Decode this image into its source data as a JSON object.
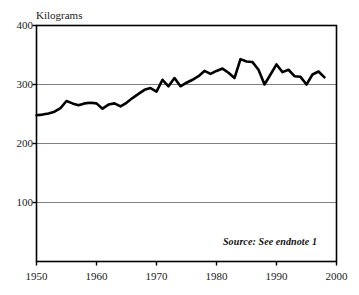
{
  "figure": {
    "y_axis_title": "Kilograms",
    "source_note": "Source: See endnote 1",
    "colors": {
      "line": "#000000",
      "axis": "#000000",
      "grid": "#808080",
      "background": "#ffffff",
      "text": "#111111"
    }
  },
  "chart_data": {
    "type": "line",
    "title": "",
    "subtitle": "",
    "xlabel": "",
    "ylabel": "Kilograms",
    "xlim": [
      1950,
      2000
    ],
    "ylim": [
      0,
      400
    ],
    "grid": true,
    "grid_axis": "y",
    "legend": false,
    "legend_position": "none",
    "annotations": [
      {
        "text": "Source: See endnote 1",
        "x": 1996,
        "y": 38,
        "style": "italic"
      }
    ],
    "ytick_labels": [
      "100",
      "200",
      "300",
      "400"
    ],
    "yticks": [
      100,
      200,
      300,
      400
    ],
    "xtick_labels": [
      "1950",
      "1960",
      "1970",
      "1980",
      "1990",
      "2000"
    ],
    "xticks": [
      1950,
      1960,
      1970,
      1980,
      1990,
      2000
    ],
    "x": [
      1950,
      1951,
      1952,
      1953,
      1954,
      1955,
      1956,
      1957,
      1958,
      1959,
      1960,
      1961,
      1962,
      1963,
      1964,
      1965,
      1966,
      1967,
      1968,
      1969,
      1970,
      1971,
      1972,
      1973,
      1974,
      1975,
      1976,
      1977,
      1978,
      1979,
      1980,
      1981,
      1982,
      1983,
      1984,
      1985,
      1986,
      1987,
      1988,
      1989,
      1990,
      1991,
      1992,
      1993,
      1994,
      1995,
      1996,
      1997,
      1998
    ],
    "values": [
      248,
      249,
      251,
      254,
      260,
      272,
      268,
      265,
      268,
      269,
      268,
      259,
      266,
      268,
      263,
      269,
      277,
      284,
      291,
      294,
      288,
      308,
      297,
      311,
      297,
      303,
      308,
      314,
      323,
      318,
      323,
      327,
      320,
      311,
      343,
      339,
      338,
      325,
      300,
      317,
      334,
      321,
      325,
      314,
      313,
      300,
      317,
      322,
      312
    ],
    "series": [
      {
        "name": "Kilograms",
        "color": "#000000",
        "values": [
          248,
          249,
          251,
          254,
          260,
          272,
          268,
          265,
          268,
          269,
          268,
          259,
          266,
          268,
          263,
          269,
          277,
          284,
          291,
          294,
          288,
          308,
          297,
          311,
          297,
          303,
          308,
          314,
          323,
          318,
          323,
          327,
          320,
          311,
          343,
          339,
          338,
          325,
          300,
          317,
          334,
          321,
          325,
          314,
          313,
          300,
          317,
          322,
          312
        ]
      }
    ]
  }
}
